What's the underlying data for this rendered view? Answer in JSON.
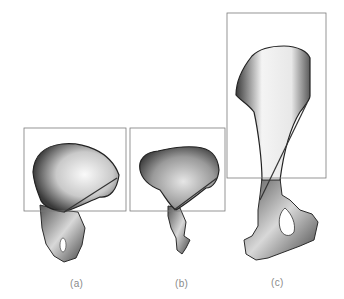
{
  "figure": {
    "panels": [
      {
        "id": "a",
        "label": "(a)",
        "description": "pelvis with tall rounded ilium blade",
        "box": {
          "x": 24,
          "y": 128,
          "w": 102,
          "h": 83
        },
        "axis_line": {
          "x1": 117,
          "y1": 178,
          "x2": 64,
          "y2": 212
        }
      },
      {
        "id": "b",
        "label": "(b)",
        "description": "pelvis with broad ilium blade and slender ischium",
        "box": {
          "x": 130,
          "y": 128,
          "w": 95,
          "h": 83
        },
        "axis_line": {
          "x1": 217,
          "y1": 178,
          "x2": 174,
          "y2": 210
        }
      },
      {
        "id": "c",
        "label": "(c)",
        "description": "elongated pelvis with obturator foramen",
        "box": {
          "x": 227,
          "y": 13,
          "w": 99,
          "h": 165
        },
        "axis_line": {
          "x1": 307,
          "y1": 103,
          "x2": 260,
          "y2": 200
        }
      }
    ],
    "colors": {
      "box_stroke": "#7a7a7a",
      "bone_dark": "#2b2b2b",
      "bone_mid": "#8c8c8c",
      "bone_light": "#f2f2f2",
      "label": "#8a8a8a"
    }
  }
}
